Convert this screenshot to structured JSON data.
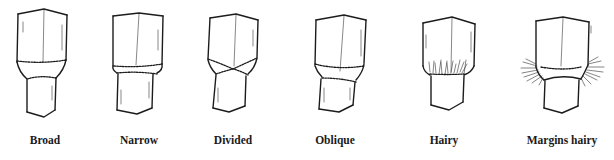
{
  "figure": {
    "type": "botanical illustration",
    "colors": {
      "ink": "#1c1c1c",
      "background": "#ffffff"
    },
    "items": [
      {
        "label": "Broad",
        "center_x": 45
      },
      {
        "label": "Narrow",
        "center_x": 139
      },
      {
        "label": "Divided",
        "center_x": 233
      },
      {
        "label": "Oblique",
        "center_x": 334
      },
      {
        "label": "Hairy",
        "center_x": 444
      },
      {
        "label": "Margins hairy",
        "center_x": 556
      }
    ]
  }
}
